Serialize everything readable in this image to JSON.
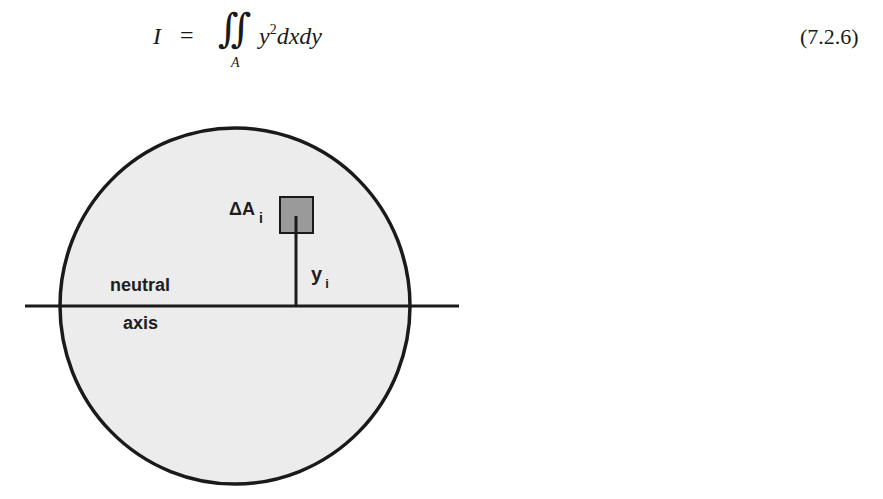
{
  "equation": {
    "lhs": "I",
    "equals": "=",
    "integral_symbol": "∫∫",
    "limit": "A",
    "integrand_base": "y",
    "integrand_exponent": "2",
    "integrand_rest": "dxdy",
    "number": "(7.2.6)"
  },
  "figure": {
    "labels": {
      "neutral": "neutral",
      "axis": "axis",
      "area_element_main": "ΔA",
      "area_element_sub": "i",
      "distance_main": "y",
      "distance_sub": "i"
    },
    "colors": {
      "circle_fill": "#ececec",
      "circle_stroke": "#1a1a1a",
      "area_element_fill": "#9a9a9a",
      "line": "#1a1a1a"
    }
  }
}
